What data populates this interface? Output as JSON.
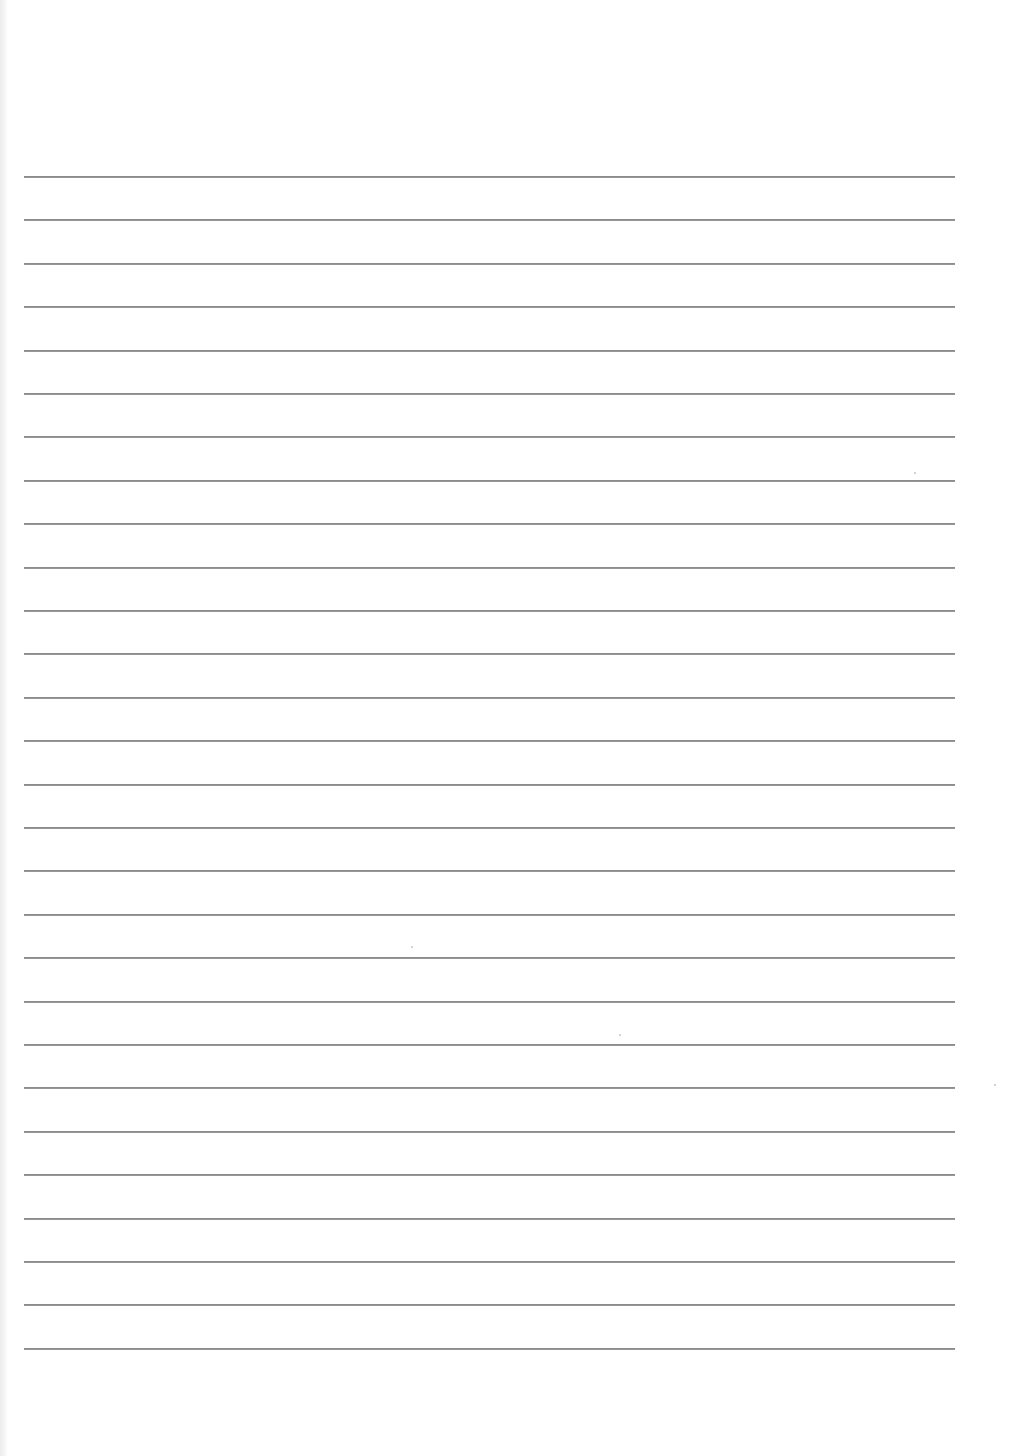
{
  "document": {
    "type": "ruled-sheet",
    "background_color": "#ffffff",
    "rule_color": "#8a8a8a",
    "rules": {
      "count": 28,
      "first_y": 176,
      "spacing": 43.4,
      "x_start": 24,
      "x_end": 955
    },
    "specks": [
      {
        "x": 411,
        "y": 946
      },
      {
        "x": 619,
        "y": 1034
      },
      {
        "x": 914,
        "y": 472
      },
      {
        "x": 994,
        "y": 1084
      }
    ]
  }
}
